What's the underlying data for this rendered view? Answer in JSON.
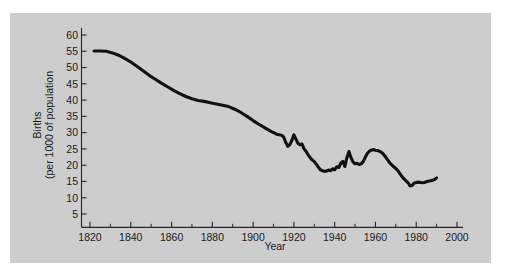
{
  "figure": {
    "background_color": "#ffffff",
    "panel_color": "#cdcdcd",
    "line_color": "#111111",
    "text_color": "#1a1a1a"
  },
  "chart_data": {
    "type": "line",
    "title": "",
    "xlabel": "Year",
    "ylabel": "Births (per 1000 of population",
    "ylabel_lines": [
      "Births",
      "(per 1000 of population"
    ],
    "xlim": [
      1815,
      2005
    ],
    "ylim": [
      0,
      62
    ],
    "grid": false,
    "legend": "none",
    "x_ticks_major": [
      1820,
      1840,
      1860,
      1880,
      1900,
      1920,
      1940,
      1960,
      1980,
      2000
    ],
    "x_tick_labels": [
      "1820",
      "1840",
      "1860",
      "1880",
      "1900",
      "1920",
      "1940",
      "1960",
      "1980",
      "2000"
    ],
    "x_ticks_minor": [
      1830,
      1850,
      1870,
      1890,
      1910,
      1930,
      1950,
      1970,
      1990
    ],
    "y_ticks_major": [
      5,
      10,
      15,
      20,
      25,
      30,
      35,
      40,
      45,
      50,
      55,
      60
    ],
    "y_tick_labels": [
      "5",
      "10",
      "15",
      "20",
      "25",
      "30",
      "35",
      "40",
      "45",
      "50",
      "55",
      "60"
    ],
    "series": [
      {
        "name": "Birth rate",
        "x": [
          1822,
          1825,
          1828,
          1831,
          1834,
          1837,
          1840,
          1843,
          1846,
          1849,
          1852,
          1855,
          1858,
          1861,
          1864,
          1867,
          1870,
          1873,
          1876,
          1879,
          1882,
          1885,
          1888,
          1891,
          1894,
          1897,
          1900,
          1903,
          1906,
          1909,
          1912,
          1914,
          1915,
          1916,
          1917,
          1918,
          1919,
          1920,
          1921,
          1922,
          1923,
          1924,
          1925,
          1926,
          1927,
          1928,
          1929,
          1930,
          1931,
          1932,
          1933,
          1934,
          1935,
          1936,
          1937,
          1938,
          1939,
          1940,
          1941,
          1942,
          1943,
          1944,
          1945,
          1946,
          1947,
          1948,
          1949,
          1950,
          1951,
          1952,
          1953,
          1954,
          1955,
          1956,
          1957,
          1958,
          1959,
          1960,
          1961,
          1962,
          1963,
          1964,
          1965,
          1966,
          1967,
          1968,
          1969,
          1970,
          1971,
          1972,
          1973,
          1974,
          1975,
          1976,
          1977,
          1978,
          1979,
          1980,
          1981,
          1982,
          1983,
          1984,
          1985,
          1986,
          1987,
          1988,
          1989,
          1990
        ],
        "values": [
          55.1,
          55.1,
          55.0,
          54.5,
          53.8,
          52.8,
          51.7,
          50.4,
          49.0,
          47.6,
          46.4,
          45.2,
          44.1,
          43.0,
          42.0,
          41.1,
          40.4,
          39.9,
          39.6,
          39.2,
          38.8,
          38.4,
          38.0,
          37.2,
          36.2,
          35.0,
          33.7,
          32.5,
          31.4,
          30.3,
          29.4,
          29.2,
          28.6,
          27.0,
          25.8,
          26.3,
          27.6,
          29.3,
          28.0,
          26.7,
          26.3,
          26.5,
          25.0,
          24.2,
          23.2,
          22.3,
          21.6,
          21.1,
          20.3,
          19.4,
          18.6,
          18.3,
          18.1,
          18.2,
          18.5,
          18.3,
          18.9,
          18.6,
          19.5,
          19.3,
          20.6,
          21.2,
          19.6,
          22.3,
          24.2,
          22.3,
          21.0,
          20.4,
          20.6,
          20.2,
          20.4,
          21.1,
          22.4,
          23.6,
          24.3,
          24.6,
          24.8,
          24.6,
          24.5,
          24.3,
          23.9,
          23.3,
          22.5,
          21.6,
          20.7,
          20.1,
          19.5,
          19.0,
          18.3,
          17.4,
          16.5,
          15.8,
          15.2,
          14.6,
          13.6,
          13.8,
          14.5,
          14.7,
          14.8,
          14.7,
          14.6,
          14.7,
          14.9,
          15.1,
          15.2,
          15.4,
          15.6,
          16.1
        ]
      }
    ]
  }
}
